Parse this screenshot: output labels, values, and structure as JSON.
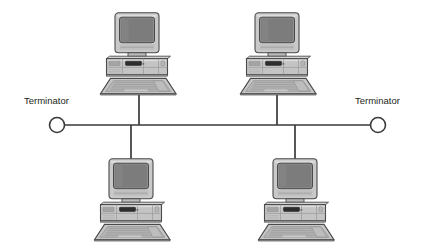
{
  "diagram": {
    "type": "network-topology",
    "topology": "bus",
    "background_color": "#ffffff",
    "canvas": {
      "width": 421,
      "height": 244
    }
  },
  "colors": {
    "line": "#3a3a3c",
    "text": "#231f20",
    "monitor_bezel": "#c9c9c9",
    "monitor_bezel_light": "#dcdcdc",
    "monitor_bezel_dark": "#9a9a9a",
    "screen": "#8e8e8e",
    "screen_dark": "#7c7c7c",
    "case_body": "#c4c4c4",
    "case_light": "#d8d8d8",
    "case_dark": "#a0a0a0",
    "keyboard": "#c0c0c0",
    "keyboard_dark": "#9c9c9c",
    "slot_dark": "#2e2e2e",
    "outline": "#4a4a4c",
    "terminator_fill": "#ffffff"
  },
  "bus": {
    "name": "backbone-cable",
    "y": 125,
    "x_start": 58,
    "x_end": 372,
    "stroke_width": 1.6
  },
  "terminators": [
    {
      "id": "terminator-left",
      "label": "Terminator",
      "label_x": 24,
      "label_y": 104,
      "circle_cx": 57,
      "circle_cy": 125,
      "radius": 7.5
    },
    {
      "id": "terminator-right",
      "label": "Terminator",
      "label_x": 355,
      "label_y": 104,
      "circle_cx": 378,
      "circle_cy": 125,
      "radius": 7.5
    }
  ],
  "nodes": [
    {
      "id": "workstation-top-left",
      "label": "",
      "position": "top-left",
      "icon": "desktop-computer-icon",
      "x": 98,
      "y": 12,
      "drop_line": {
        "x": 139,
        "y_from": 93,
        "y_to": 125
      }
    },
    {
      "id": "workstation-top-right",
      "label": "",
      "position": "top-right",
      "icon": "desktop-computer-icon",
      "x": 243,
      "y": 12,
      "drop_line": {
        "x": 277,
        "y_from": 93,
        "y_to": 125
      }
    },
    {
      "id": "workstation-bottom-left",
      "label": "",
      "position": "bottom-left",
      "icon": "desktop-computer-icon",
      "x": 98,
      "y": 155,
      "drop_line": {
        "x": 131,
        "y_from": 125,
        "y_to": 160
      }
    },
    {
      "id": "workstation-bottom-right",
      "label": "",
      "position": "bottom-right",
      "icon": "desktop-computer-icon",
      "x": 243,
      "y": 155,
      "drop_line": {
        "x": 295,
        "y_from": 125,
        "y_to": 160
      }
    }
  ]
}
